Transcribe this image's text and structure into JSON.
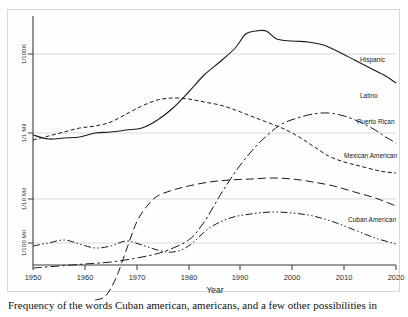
{
  "figure": {
    "caption": "Frequency of the words Cuban american, americans, and a few other possibilities in"
  },
  "chart_data": {
    "type": "line",
    "title": "",
    "subtitle": "",
    "xlabel": "Year",
    "ylabel": "",
    "xlim": [
      1950,
      2020
    ],
    "ylim_labels": [
      "1/100 Mil",
      "1/10 Mil",
      "1/1 Mil",
      "1/100K"
    ],
    "x_ticks": [
      "1950",
      "1960",
      "1970",
      "1980",
      "1990",
      "2000",
      "2010",
      "2020"
    ],
    "y_ticks": [
      "1/100K",
      "1/1 Mil",
      "1/10 Mil",
      "1/100 Mil"
    ],
    "grid": true,
    "legend_position": "right-inline",
    "scale": "log",
    "series": [
      {
        "name": "Hispanic",
        "dash": "solid",
        "x": [
          1950,
          1953,
          1956,
          1959,
          1962,
          1965,
          1968,
          1971,
          1974,
          1977,
          1980,
          1983,
          1986,
          1989,
          1991,
          1993,
          1995,
          1997,
          2000,
          2003,
          2006,
          2009,
          2012,
          2015,
          2018,
          2020
        ],
        "y": [
          135,
          139,
          138,
          137,
          133,
          132,
          130,
          128,
          120,
          108,
          92,
          75,
          62,
          48,
          34,
          31,
          31,
          39,
          41,
          42,
          45,
          52,
          60,
          68,
          76,
          83
        ]
      },
      {
        "name": "Latino",
        "dash": "dashdot-long",
        "x": [
          1950,
          1955,
          1960,
          1965,
          1970,
          1975,
          1980,
          1983,
          1986,
          1989,
          1992,
          1995,
          1998,
          2001,
          2004,
          2007,
          2010,
          2013,
          2016,
          2018,
          2020
        ],
        "y": [
          268,
          266,
          264,
          262,
          258,
          252,
          240,
          222,
          196,
          172,
          152,
          136,
          124,
          118,
          114,
          113,
          116,
          122,
          130,
          137,
          143
        ]
      },
      {
        "name": "Puerto Rican",
        "dash": "dashed-short",
        "x": [
          1950,
          1953,
          1956,
          1959,
          1962,
          1965,
          1968,
          1971,
          1974,
          1977,
          1980,
          1983,
          1986,
          1989,
          1992,
          1995,
          1998,
          2001,
          2004,
          2007,
          2010,
          2013,
          2016,
          2018,
          2020
        ],
        "y": [
          140,
          136,
          132,
          128,
          126,
          122,
          114,
          106,
          100,
          98,
          99,
          102,
          105,
          110,
          116,
          122,
          128,
          136,
          146,
          156,
          162,
          166,
          170,
          172,
          173
        ]
      },
      {
        "name": "Mexican American",
        "dash": "dashed-long",
        "x": [
          1962,
          1964,
          1966,
          1968,
          1970,
          1972,
          1974,
          1977,
          1980,
          1984,
          1988,
          1992,
          1996,
          2000,
          2004,
          2008,
          2012,
          2016,
          2020
        ],
        "y": [
          300,
          296,
          278,
          250,
          222,
          206,
          196,
          190,
          186,
          182,
          180,
          179,
          178,
          179,
          182,
          186,
          192,
          198,
          206
        ]
      },
      {
        "name": "Cuban American",
        "dash": "dashdotdot",
        "x": [
          1950,
          1953,
          1956,
          1959,
          1962,
          1965,
          1968,
          1971,
          1974,
          1977,
          1980,
          1984,
          1988,
          1992,
          1996,
          2000,
          2004,
          2008,
          2012,
          2016,
          2020
        ],
        "y": [
          246,
          243,
          240,
          244,
          248,
          246,
          241,
          245,
          250,
          252,
          246,
          228,
          218,
          214,
          212,
          213,
          216,
          222,
          230,
          238,
          244
        ]
      }
    ],
    "series_labels": [
      {
        "name": "Hispanic"
      },
      {
        "name": "Latino"
      },
      {
        "name": "Puerto Rican"
      },
      {
        "name": "Mexican American"
      },
      {
        "name": "Cuban American"
      }
    ]
  }
}
